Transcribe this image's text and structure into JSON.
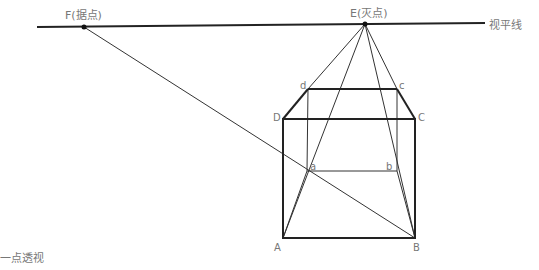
{
  "diagram": {
    "title": "一点透视",
    "horizon_label": "视平线",
    "vanishing_point_label": "E(灭点)",
    "measuring_point_label": "F(据点)",
    "colors": {
      "line": "#222222",
      "label": "#777777",
      "background": "#ffffff"
    },
    "points": {
      "E": {
        "label": "E(灭点)",
        "x": 365,
        "y": 24
      },
      "F": {
        "label": "F(据点)",
        "x": 84,
        "y": 27
      },
      "A": {
        "label": "A",
        "x": 283,
        "y": 238
      },
      "B": {
        "label": "B",
        "x": 415,
        "y": 238
      },
      "C": {
        "label": "C",
        "x": 415,
        "y": 119
      },
      "D": {
        "label": "D",
        "x": 283,
        "y": 119
      },
      "a": {
        "label": "a",
        "x": 307,
        "y": 171
      },
      "b": {
        "label": "b",
        "x": 397,
        "y": 171
      },
      "c": {
        "label": "c",
        "x": 397,
        "y": 89
      },
      "d": {
        "label": "d",
        "x": 308,
        "y": 89
      }
    },
    "labels": {
      "A": "A",
      "B": "B",
      "C": "C",
      "D": "D",
      "a": "a",
      "b": "b",
      "c": "c",
      "d": "d"
    }
  }
}
